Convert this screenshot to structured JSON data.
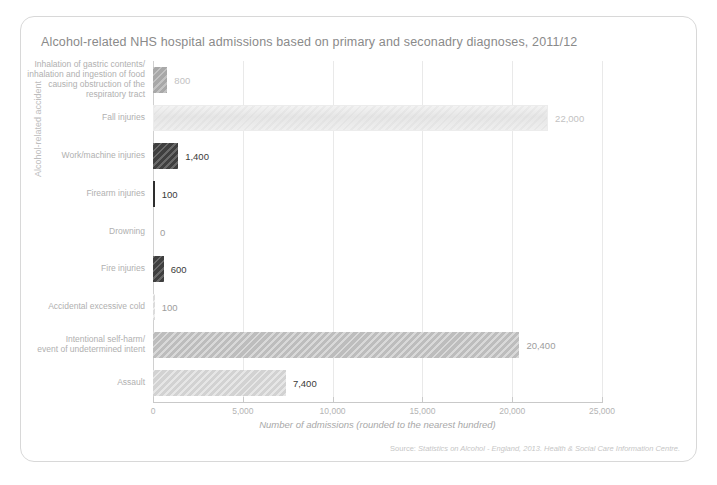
{
  "chart_data": {
    "type": "bar",
    "orientation": "horizontal",
    "title": "Alcohol-related NHS hospital admissions based on primary and seconadry diagnoses, 2011/12",
    "xlabel": "Number of admissions (rounded to the nearest hundred)",
    "ylabel": "Alcohol-related accident",
    "xlim": [
      0,
      25000
    ],
    "xticks": [
      0,
      5000,
      10000,
      15000,
      20000,
      25000
    ],
    "xtick_labels": [
      "0",
      "5,000",
      "10,000",
      "15,000",
      "20,000",
      "25,000"
    ],
    "grid": true,
    "legend": "none",
    "categories": [
      "Inhalation of gastric contents/\ninhalation and ingestion of food\ncausing obstruction of the\nrespiratory tract",
      "Fall injuries",
      "Work/machine injuries",
      "Firearm injuries",
      "Drowning",
      "Fire injuries",
      "Accidental excessive cold",
      "Intentional self-harm/\nevent of undetermined intent",
      "Assault"
    ],
    "values": [
      800,
      22000,
      1400,
      100,
      0,
      600,
      100,
      20400,
      7400
    ],
    "value_labels": [
      "800",
      "22,000",
      "1,400",
      "100",
      "0",
      "600",
      "100",
      "20,400",
      "7,400"
    ],
    "source": {
      "label": "Source:",
      "body": "Statistics on Alcohol - England, 2013. Health & Social Care Information Centre."
    }
  },
  "bar_styles": [
    "fill-mid",
    "fill-pale",
    "fill-dark",
    "fill-darkest",
    "fill-none",
    "fill-dark",
    "fill-palest",
    "fill-lightmid",
    "fill-light"
  ],
  "value_label_tones": [
    "faint",
    "faint",
    "",
    "",
    "mid",
    "",
    "mid",
    "mid",
    ""
  ]
}
